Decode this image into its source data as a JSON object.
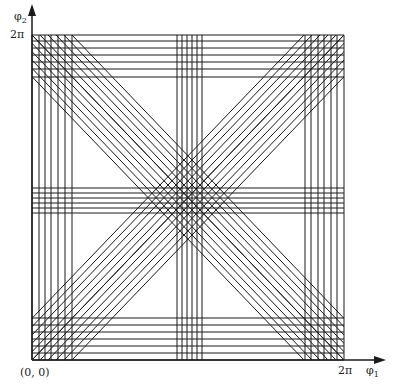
{
  "diagram": {
    "axes": {
      "x_label": "φ",
      "x_label_sub": "1",
      "y_label": "φ",
      "y_label_sub": "2",
      "origin_label": "(0, 0)",
      "x_max_label": "2π",
      "y_max_label": "2π"
    },
    "frame": {
      "x0": 32,
      "y0": 35,
      "x1": 344,
      "y1": 360
    },
    "vertical_line_groups": [
      [
        32,
        39,
        45,
        51,
        58,
        65,
        72
      ],
      [
        177,
        182,
        187,
        192,
        197,
        202
      ],
      [
        305,
        311,
        318,
        324,
        331,
        337,
        344
      ]
    ],
    "horizontal_line_groups": [
      [
        35,
        41,
        48,
        55,
        62,
        69,
        77
      ],
      [
        188,
        193,
        198,
        203,
        208,
        213
      ],
      [
        318,
        325,
        332,
        339,
        346,
        353,
        360
      ]
    ],
    "diagonal_offsets": [
      0,
      8,
      16,
      24,
      32,
      40
    ],
    "colors": {
      "line": "#1a1a1a",
      "background": "#ffffff"
    }
  }
}
